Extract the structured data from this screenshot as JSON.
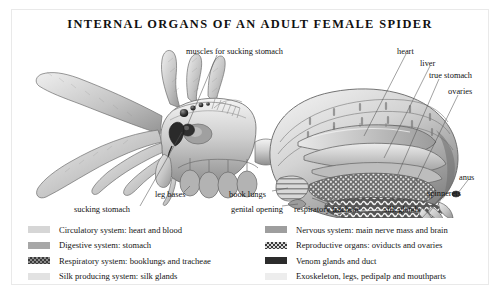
{
  "page": {
    "title": "INTERNAL ORGANS OF AN ADULT FEMALE SPIDER",
    "background_color": "#ffffff",
    "frame_color": "#e9e9e9"
  },
  "illustration": {
    "name": "adult-female-spider-cutaway",
    "description": "Pencil-style cutaway drawing of an adult female spider shown in left profile with legs to the left and abdomen to the right, internal organs exposed",
    "ink_color": "#5d5d5d"
  },
  "callouts": [
    {
      "id": "muscles-for-sucking-stomach",
      "text": "muscles for sucking stomach",
      "x": 186,
      "y": 48,
      "anchor": "left"
    },
    {
      "id": "heart",
      "text": "heart",
      "x": 397,
      "y": 48,
      "anchor": "left"
    },
    {
      "id": "liver",
      "text": "liver",
      "x": 420,
      "y": 60,
      "anchor": "left"
    },
    {
      "id": "true-stomach",
      "text": "true stomach",
      "x": 429,
      "y": 72,
      "anchor": "left"
    },
    {
      "id": "ovaries",
      "text": "ovaries",
      "x": 448,
      "y": 88,
      "anchor": "left"
    },
    {
      "id": "anus",
      "text": "anus",
      "x": 459,
      "y": 174,
      "anchor": "left"
    },
    {
      "id": "spinnerets",
      "text": "spinnerets",
      "x": 427,
      "y": 190,
      "anchor": "left"
    },
    {
      "id": "silk-glands",
      "text": "silk glands",
      "x": 384,
      "y": 206,
      "anchor": "left"
    },
    {
      "id": "respiratory-tracheae",
      "text": "respiratory tracheae",
      "x": 294,
      "y": 206,
      "anchor": "left"
    },
    {
      "id": "genital-opening",
      "text": "genital opening",
      "x": 231,
      "y": 206,
      "anchor": "left"
    },
    {
      "id": "book-lungs",
      "text": "book lungs",
      "x": 229,
      "y": 191,
      "anchor": "left"
    },
    {
      "id": "leg-bases",
      "text": "leg bases",
      "x": 155,
      "y": 191,
      "anchor": "left"
    },
    {
      "id": "sucking-stomach",
      "text": "sucking stomach",
      "x": 74,
      "y": 206,
      "anchor": "left"
    }
  ],
  "legend": {
    "left_items": [
      {
        "id": "circulatory-system",
        "label": "Circulatory system: heart and blood",
        "color": "#d6d6d6",
        "pattern": false
      },
      {
        "id": "digestive-system",
        "label": "Digestive system: stomach",
        "color": "#a7a7a7",
        "pattern": false
      },
      {
        "id": "respiratory-system",
        "label": "Respiratory system: booklungs and tracheae",
        "color": "#8a8a8a",
        "pattern": true
      },
      {
        "id": "silk-producing-system",
        "label": "Silk producing system: silk glands",
        "color": "#e2e2e2",
        "pattern": false
      }
    ],
    "right_items": [
      {
        "id": "nervous-system",
        "label": "Nervous system: main nerve mass and brain",
        "color": "#9e9e9e",
        "pattern": false
      },
      {
        "id": "reproductive-organs",
        "label": "Reproductive organs: oviducts and ovaries",
        "color": "#4a4a4a",
        "pattern": true
      },
      {
        "id": "venom-glands",
        "label": "Venom glands and duct",
        "color": "#2c2c2c",
        "pattern": false
      },
      {
        "id": "exoskeleton",
        "label": "Exoskeleton, legs, pedipalp and mouthparts",
        "color": "#ededed",
        "pattern": false
      }
    ]
  }
}
